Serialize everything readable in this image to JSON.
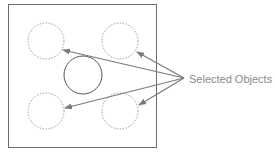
{
  "diagram": {
    "label": "Selected Objects",
    "colors": {
      "frame": "#6a6a6a",
      "dashed_circle": "#9a9a9a",
      "solid_circle": "#555555",
      "arrow": "#7a7a7a",
      "label": "#8a8a8a"
    },
    "objects": [
      {
        "id": "top-left",
        "selected": true
      },
      {
        "id": "top-right",
        "selected": true
      },
      {
        "id": "center",
        "selected": false
      },
      {
        "id": "bottom-left",
        "selected": true
      },
      {
        "id": "bottom-right",
        "selected": true
      }
    ]
  }
}
